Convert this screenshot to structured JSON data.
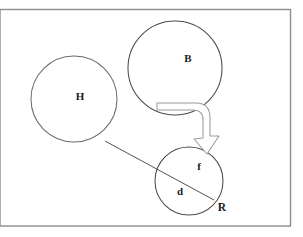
{
  "figure": {
    "kind": "line-diagram",
    "background_color": "#ffffff",
    "stroke_color": "#4a4a4a",
    "label_color": "#1a1a1a",
    "frame": {
      "name": "outer-border",
      "x": 0,
      "y": 9,
      "width": 291,
      "height": 217,
      "stroke_color": "#8c8c8c",
      "fill": "none"
    },
    "circles": [
      {
        "id": "circle-H",
        "label": "H",
        "cx": 74,
        "cy": 99,
        "r": 43,
        "label_x": 80,
        "label_y": 97,
        "fill": "none",
        "stroke_color": "#6b6b6b"
      },
      {
        "id": "circle-B",
        "label": "B",
        "cx": 175,
        "cy": 68,
        "r": 47,
        "label_x": 188,
        "label_y": 59,
        "fill": "none",
        "stroke_color": "#4a4a4a"
      },
      {
        "id": "circle-fd",
        "label": "",
        "cx": 189,
        "cy": 181,
        "r": 34,
        "label_x": 0,
        "label_y": 0,
        "fill": "none",
        "stroke_color": "#4a4a4a"
      }
    ],
    "inner_labels": [
      {
        "id": "label-f",
        "text": "f",
        "x": 199,
        "y": 167
      },
      {
        "id": "label-d",
        "text": "d",
        "x": 180,
        "y": 192
      },
      {
        "id": "label-R",
        "text": "R",
        "x": 221,
        "y": 208
      }
    ],
    "connectors": [
      {
        "id": "connector-H-to-R",
        "type": "straight-line",
        "from": "circle-H",
        "to": "label-R",
        "x1": 105,
        "y1": 141,
        "x2": 214,
        "y2": 200,
        "stroke_color": "#4a4a4a"
      }
    ],
    "arrows": [
      {
        "id": "block-arrow-B-to-fd",
        "type": "curved-block-arrow",
        "from": "circle-B",
        "to": "circle-fd",
        "tail_x": 157,
        "tail_y": 103,
        "head_x": 212,
        "head_y": 152,
        "fill": "#ffffff",
        "stroke_color": "#9a9a9a"
      }
    ]
  }
}
